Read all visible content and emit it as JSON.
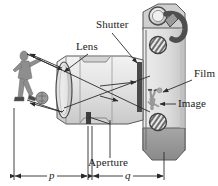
{
  "figure": {
    "kind": "optics-diagram",
    "background_color": "#ffffff",
    "ink_color": "#1a1a1a"
  },
  "labels": {
    "shutter": "Shutter",
    "lens": "Lens",
    "film": "Film",
    "image": "Image",
    "aperture": "Aperture"
  },
  "dimensions": {
    "object_distance": "p",
    "image_distance": "q"
  },
  "objects": {
    "subject": "soccer-player-with-ball",
    "inverted_image": "inverted-soccer-player"
  },
  "colors": {
    "body_light": "#e6e6e6",
    "body_mid": "#cfcfcf",
    "body_dark": "#a8a8a8",
    "grip_dark": "#8c8c8c",
    "shutter_bar": "#4a4a4a",
    "line": "#2b2b2b"
  }
}
